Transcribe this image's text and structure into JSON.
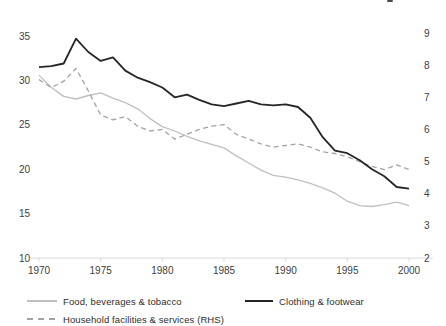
{
  "colors": {
    "background": "#ffffff",
    "axis_line": "#d9d9d9",
    "tick_text": "#404040"
  },
  "chart_data": {
    "type": "line",
    "grid": false,
    "legend_position": "bottom",
    "x": [
      1970,
      1971,
      1972,
      1973,
      1974,
      1975,
      1976,
      1977,
      1978,
      1979,
      1980,
      1981,
      1982,
      1983,
      1984,
      1985,
      1986,
      1987,
      1988,
      1989,
      1990,
      1991,
      1992,
      1993,
      1994,
      1995,
      1996,
      1997,
      1998,
      1999,
      2000
    ],
    "x_ticks": [
      1970,
      1975,
      1980,
      1985,
      1990,
      1995,
      2000
    ],
    "left_axis": {
      "range": [
        10,
        35
      ],
      "ticks": [
        10,
        15,
        20,
        25,
        30,
        35
      ]
    },
    "right_axis": {
      "range": [
        2,
        9
      ],
      "ticks": [
        2,
        3,
        4,
        5,
        6,
        7,
        8,
        9
      ]
    },
    "series": [
      {
        "name": "Food, beverages & tobacco",
        "axis": "left",
        "line": "solid",
        "color": "#bfbfbf",
        "stroke_width": 1.3,
        "values": [
          30.6,
          29.2,
          28.2,
          27.9,
          28.3,
          28.6,
          28.0,
          27.5,
          26.8,
          25.7,
          24.8,
          24.3,
          23.7,
          23.2,
          22.8,
          22.4,
          21.5,
          20.7,
          19.9,
          19.3,
          19.1,
          18.8,
          18.4,
          17.9,
          17.3,
          16.4,
          15.9,
          15.8,
          16.0,
          16.3,
          15.9
        ]
      },
      {
        "name": "Clothing & footwear",
        "axis": "left",
        "line": "solid",
        "color": "#262626",
        "stroke_width": 1.8,
        "values": [
          31.5,
          31.6,
          31.9,
          34.7,
          33.2,
          32.2,
          32.6,
          31.1,
          30.3,
          29.8,
          29.2,
          28.1,
          28.4,
          27.8,
          27.3,
          27.1,
          27.4,
          27.7,
          27.3,
          27.2,
          27.3,
          27.0,
          25.8,
          23.6,
          22.1,
          21.8,
          21.0,
          20.0,
          19.2,
          18.0,
          17.8
        ]
      },
      {
        "name": "Household facilities & services (RHS)",
        "axis": "right",
        "line": "dashed",
        "color": "#a3a3a3",
        "stroke_width": 1.3,
        "values": [
          7.55,
          7.3,
          7.5,
          7.9,
          7.2,
          6.45,
          6.3,
          6.4,
          6.1,
          5.95,
          6.0,
          5.7,
          5.85,
          6.0,
          6.1,
          6.15,
          5.85,
          5.7,
          5.55,
          5.45,
          5.5,
          5.55,
          5.45,
          5.3,
          5.25,
          5.15,
          5.0,
          4.85,
          4.75,
          4.9,
          4.75
        ]
      }
    ]
  },
  "legend": {
    "items": [
      {
        "label": "Food, beverages & tobacco"
      },
      {
        "label": "Clothing & footwear"
      },
      {
        "label": "Household facilities & services (RHS)"
      }
    ]
  }
}
